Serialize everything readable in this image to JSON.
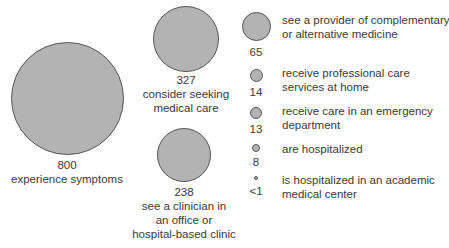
{
  "diagram": {
    "main_nodes": [
      {
        "value": "800",
        "label": "experience symptoms"
      },
      {
        "value": "327",
        "label_line1": "consider seeking",
        "label_line2": "medical care"
      },
      {
        "value": "238",
        "label_line1": "see a clinician in",
        "label_line2": "an office or",
        "label_line3": "hospital-based clinic"
      }
    ],
    "legend_nodes": [
      {
        "value": "65",
        "line1": "see a provider of complementary",
        "line2": "or alternative medicine"
      },
      {
        "value": "14",
        "line1": "receive professional care",
        "line2": "services at home"
      },
      {
        "value": "13",
        "line1": "receive care in an emergency",
        "line2": "department"
      },
      {
        "value": "8",
        "line1": "are hospitalized"
      },
      {
        "value": "<1",
        "line1": "is hospitalized in an academic",
        "line2": "medical center"
      }
    ],
    "colors": {
      "circle_fill": "#b3b3b3",
      "circle_stroke": "#555555",
      "text": "#3a3a3a"
    }
  }
}
